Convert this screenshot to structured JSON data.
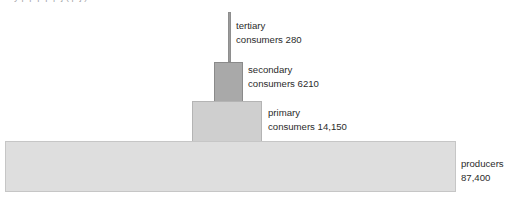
{
  "figure": {
    "cut_caption": "y  p  p  p    p  p  j    (     p  j  )",
    "background_color": "#ffffff"
  },
  "chart_data": {
    "type": "bar",
    "title": "",
    "subtitle": "",
    "xlabel": "",
    "ylabel": "",
    "orientation": "horizontal-stacked-pyramid",
    "grid": false,
    "legend": "none",
    "unit_note": "",
    "categories": [
      "tertiary consumers",
      "secondary consumers",
      "primary consumers",
      "producers"
    ],
    "values": [
      280,
      6210,
      14150,
      87400
    ],
    "value_labels": [
      "280",
      "6210",
      "14,150",
      "87,400"
    ],
    "colors": [
      "#9b9b9b",
      "#a9a9a9",
      "#cfcfcf",
      "#dedede"
    ],
    "levels": [
      {
        "name": "tertiary",
        "label_line1": "tertiary",
        "label_line2": "consumers 280",
        "value": 280,
        "value_text": "280",
        "fill": "#9b9b9b",
        "stroke": "#8e8e8e"
      },
      {
        "name": "secondary",
        "label_line1": "secondary",
        "label_line2": "consumers 6210",
        "value": 6210,
        "value_text": "6210",
        "fill": "#a9a9a9",
        "stroke": "#8a8a8a"
      },
      {
        "name": "primary",
        "label_line1": "primary",
        "label_line2": "consumers 14,150",
        "value": 14150,
        "value_text": "14,150",
        "fill": "#cfcfcf",
        "stroke": "#b4b4b4"
      },
      {
        "name": "producers",
        "label_line1": "producers",
        "label_line2": "87,400",
        "value": 87400,
        "value_text": "87,400",
        "fill": "#dedede",
        "stroke": "#c6c6c6"
      }
    ]
  }
}
